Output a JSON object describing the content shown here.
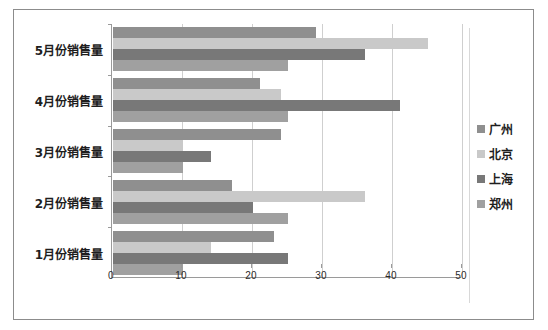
{
  "chart_data": {
    "type": "bar",
    "orientation": "horizontal",
    "title": "",
    "xlabel": "",
    "ylabel": "",
    "xlim": [
      0,
      50
    ],
    "xticks": [
      0,
      10,
      20,
      30,
      40,
      50
    ],
    "grid": true,
    "legend_position": "right",
    "categories": [
      "1月份销售量",
      "2月份销售量",
      "3月份销售量",
      "4月份销售量",
      "5月份销售量"
    ],
    "series": [
      {
        "name": "广州",
        "color": "#8f8f8f",
        "values": [
          23,
          17,
          24,
          21,
          29
        ]
      },
      {
        "name": "北京",
        "color": "#c9c9c9",
        "values": [
          14,
          36,
          10,
          24,
          45
        ]
      },
      {
        "name": "上海",
        "color": "#787878",
        "values": [
          25,
          20,
          14,
          41,
          36
        ]
      },
      {
        "name": "郑州",
        "color": "#a0a0a0",
        "values": [
          10,
          25,
          10,
          25,
          25
        ]
      }
    ]
  },
  "legend": {
    "items": [
      {
        "label": "广州"
      },
      {
        "label": "北京"
      },
      {
        "label": "上海"
      },
      {
        "label": "郑州"
      }
    ]
  },
  "axis": {
    "x_tick_labels": [
      "0",
      "10",
      "20",
      "30",
      "40",
      "50"
    ]
  }
}
